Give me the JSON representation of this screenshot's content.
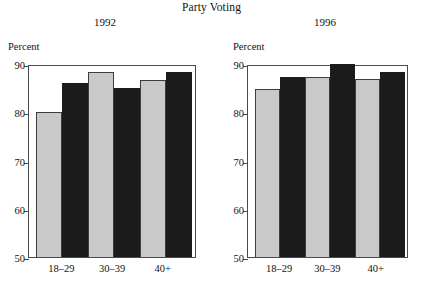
{
  "figure": {
    "title": "Party Voting",
    "y_axis_label": "Percent"
  },
  "chart_data": {
    "type": "bar",
    "title": "Party Voting",
    "xlabel": "",
    "ylabel": "Percent",
    "ylim": [
      50,
      90
    ],
    "yticks": [
      50,
      60,
      70,
      80,
      90
    ],
    "grid": false,
    "legend": "none",
    "categories": [
      "18–29",
      "30–39",
      "40+"
    ],
    "panels": [
      {
        "subtitle": "1992",
        "ylabel": "Percent",
        "categories": [
          "18–29",
          "30–39",
          "40+"
        ],
        "series": [
          {
            "name": "light",
            "values": [
              80.1,
              88.3,
              86.7
            ]
          },
          {
            "name": "dark",
            "values": [
              86.1,
              85.1,
              88.3
            ]
          }
        ]
      },
      {
        "subtitle": "1996",
        "ylabel": "Percent",
        "categories": [
          "18–29",
          "30–39",
          "40+"
        ],
        "series": [
          {
            "name": "light",
            "values": [
              84.8,
              87.3,
              86.8
            ]
          },
          {
            "name": "dark",
            "values": [
              87.4,
              89.9,
              88.4
            ]
          }
        ]
      }
    ],
    "colors": {
      "light_bar": "#c9c9c9",
      "dark_bar": "#1b1b1b",
      "axis": "#4a4a4a",
      "text": "#111111"
    }
  }
}
